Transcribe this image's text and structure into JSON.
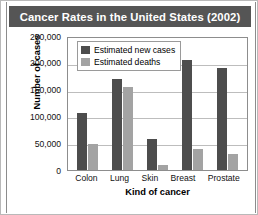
{
  "title": "Cancer Rates in the United States (2002)",
  "colors": {
    "title_bar": "#555555",
    "new_cases": "#4d4d4d",
    "deaths": "#a3a3a3",
    "grid": "#bdbdbd",
    "axis": "#8d8d8d"
  },
  "legend": {
    "items": [
      {
        "label": "Estimated new cases",
        "color": "#4d4d4d"
      },
      {
        "label": "Estimated deaths",
        "color": "#a3a3a3"
      }
    ]
  },
  "chart_data": {
    "type": "bar",
    "title": "Cancer Rates in the United States (2002)",
    "xlabel": "Kind of cancer",
    "ylabel": "Number of cases",
    "categories": [
      "Colon",
      "Lung",
      "Skin",
      "Breast",
      "Prostate"
    ],
    "series": [
      {
        "name": "Estimated new cases",
        "values": [
          107000,
          170000,
          58000,
          205000,
          190000
        ]
      },
      {
        "name": "Estimated deaths",
        "values": [
          48000,
          155000,
          10000,
          40000,
          30000
        ]
      }
    ],
    "ylim": [
      0,
      250000
    ],
    "yticks": [
      250000,
      200000,
      150000,
      100000,
      50000,
      0
    ],
    "ytick_labels": [
      "250,000",
      "200,000",
      "150,000",
      "100,000",
      "50,000",
      "0"
    ],
    "grid": true,
    "legend_position": "inside-top-left"
  }
}
